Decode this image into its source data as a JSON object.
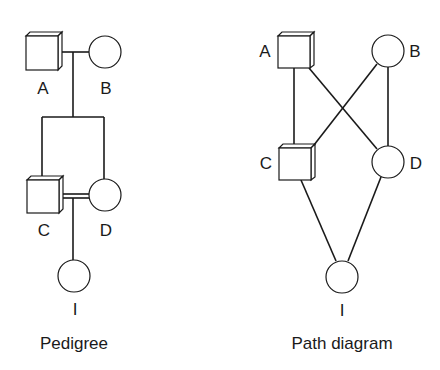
{
  "pedigree": {
    "caption": "Pedigree",
    "nodes": [
      {
        "id": "A",
        "label": "A",
        "sex": "male",
        "shape": "square"
      },
      {
        "id": "B",
        "label": "B",
        "sex": "female",
        "shape": "circle"
      },
      {
        "id": "C",
        "label": "C",
        "sex": "male",
        "shape": "square"
      },
      {
        "id": "D",
        "label": "D",
        "sex": "female",
        "shape": "circle"
      },
      {
        "id": "I",
        "label": "I",
        "sex": "female",
        "shape": "circle"
      }
    ],
    "relations": [
      {
        "type": "mating",
        "between": [
          "A",
          "B"
        ]
      },
      {
        "type": "offspring",
        "parents": [
          "A",
          "B"
        ],
        "children": [
          "C",
          "D"
        ]
      },
      {
        "type": "consanguineous-mating",
        "between": [
          "C",
          "D"
        ]
      },
      {
        "type": "offspring",
        "parents": [
          "C",
          "D"
        ],
        "children": [
          "I"
        ]
      }
    ]
  },
  "path_diagram": {
    "caption": "Path diagram",
    "nodes": [
      {
        "id": "A",
        "label": "A",
        "shape": "square"
      },
      {
        "id": "B",
        "label": "B",
        "shape": "circle"
      },
      {
        "id": "C",
        "label": "C",
        "shape": "square"
      },
      {
        "id": "D",
        "label": "D",
        "shape": "circle"
      },
      {
        "id": "I",
        "label": "I",
        "shape": "circle"
      }
    ],
    "edges": [
      [
        "A",
        "C"
      ],
      [
        "A",
        "D"
      ],
      [
        "B",
        "C"
      ],
      [
        "B",
        "D"
      ],
      [
        "C",
        "I"
      ],
      [
        "D",
        "I"
      ]
    ]
  }
}
